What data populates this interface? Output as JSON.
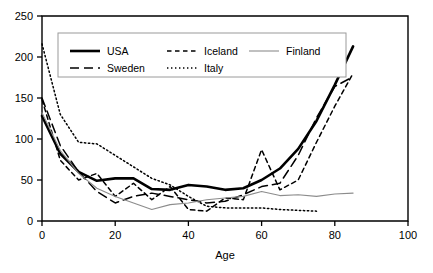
{
  "chart_data": {
    "type": "line",
    "title": "",
    "xlabel": "Age",
    "ylabel": "",
    "xlim": [
      0,
      100
    ],
    "ylim": [
      0,
      250
    ],
    "xticks": [
      0,
      20,
      40,
      60,
      80,
      100
    ],
    "yticks": [
      0,
      50,
      100,
      150,
      200,
      250
    ],
    "grid": false,
    "legend_position": "top-left-inside",
    "series": [
      {
        "name": "USA",
        "style": "solid-thick",
        "color": "#000000",
        "x": [
          0,
          5,
          10,
          15,
          20,
          25,
          30,
          35,
          40,
          45,
          50,
          55,
          60,
          65,
          70,
          75,
          80,
          85
        ],
        "y": [
          128,
          82,
          60,
          49,
          52,
          52,
          39,
          38,
          44,
          42,
          38,
          40,
          50,
          64,
          88,
          122,
          166,
          213
        ]
      },
      {
        "name": "Sweden",
        "style": "dashed-long",
        "color": "#000000",
        "x": [
          0,
          5,
          10,
          15,
          20,
          25,
          30,
          35,
          40,
          45,
          50,
          55,
          60,
          65,
          70,
          75,
          80,
          85
        ],
        "y": [
          150,
          92,
          60,
          36,
          22,
          30,
          34,
          30,
          26,
          22,
          24,
          32,
          42,
          46,
          80,
          126,
          164,
          176
        ]
      },
      {
        "name": "Iceland",
        "style": "dashed-short",
        "color": "#000000",
        "x": [
          0,
          5,
          10,
          15,
          20,
          25,
          30,
          35,
          40,
          45,
          50,
          55,
          60,
          65,
          70,
          75,
          80,
          85
        ],
        "y": [
          148,
          74,
          50,
          58,
          30,
          46,
          26,
          42,
          14,
          12,
          28,
          26,
          87,
          38,
          50,
          96,
          140,
          180
        ]
      },
      {
        "name": "Italy",
        "style": "dotted",
        "color": "#000000",
        "x": [
          0,
          5,
          10,
          15,
          20,
          25,
          30,
          35,
          40,
          45,
          50,
          55,
          60,
          65,
          70,
          75
        ],
        "y": [
          216,
          130,
          96,
          94,
          80,
          66,
          52,
          44,
          30,
          18,
          16,
          16,
          16,
          14,
          13,
          12
        ]
      },
      {
        "name": "Finland",
        "style": "solid-thin",
        "color": "#808080",
        "x": [
          0,
          5,
          10,
          15,
          20,
          25,
          30,
          35,
          40,
          45,
          50,
          55,
          60,
          65,
          70,
          75,
          80,
          85
        ],
        "y": [
          132,
          86,
          58,
          40,
          30,
          22,
          14,
          20,
          22,
          26,
          28,
          30,
          36,
          31,
          32,
          30,
          33,
          34
        ]
      }
    ],
    "legend": [
      {
        "label": "USA",
        "style": "solid-thick"
      },
      {
        "label": "Sweden",
        "style": "dashed-long"
      },
      {
        "label": "Iceland",
        "style": "dashed-short"
      },
      {
        "label": "Italy",
        "style": "dotted"
      },
      {
        "label": "Finland",
        "style": "solid-thin"
      }
    ]
  }
}
